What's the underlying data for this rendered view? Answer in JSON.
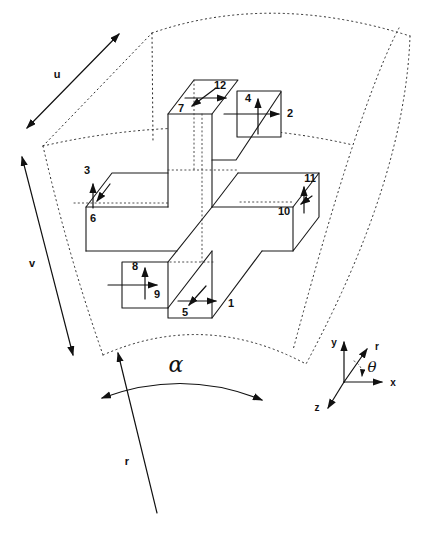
{
  "labels": {
    "n1": "1",
    "n2": "2",
    "n3": "3",
    "n4": "4",
    "n5": "5",
    "n6": "6",
    "n7": "7",
    "n8": "8",
    "n9": "9",
    "n10": "10",
    "n11": "11",
    "n12": "12",
    "u": "u",
    "v": "v",
    "r_dim": "r",
    "alpha": "α",
    "axis_x": "x",
    "axis_y": "y",
    "axis_z": "z",
    "axis_r": "r",
    "axis_theta": "θ"
  },
  "colors": {
    "ink": "#1a1a1a",
    "background": "#ffffff"
  }
}
